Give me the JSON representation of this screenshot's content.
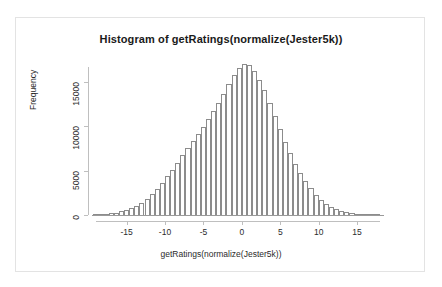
{
  "chart_data": {
    "type": "bar",
    "title": "Histogram of getRatings(normalize(Jester5k))",
    "xlabel": "getRatings(normalize(Jester5k))",
    "ylabel": "Frequency",
    "xlim": [
      -19.5,
      18.5
    ],
    "ylim": [
      0,
      17500
    ],
    "grid": false,
    "legend": null,
    "bin_width": 0.6667,
    "x_ticks": [
      -15,
      -10,
      -5,
      0,
      5,
      10,
      15
    ],
    "x_tick_labels": [
      "-15",
      "-10",
      "-5",
      "0",
      "5",
      "10",
      "15"
    ],
    "y_ticks": [
      0,
      5000,
      10000,
      15000
    ],
    "y_tick_labels": [
      "0",
      "5000",
      "10000",
      "15000"
    ],
    "bin_centers": [
      -19.0,
      -18.33,
      -17.67,
      -17.0,
      -16.33,
      -15.67,
      -15.0,
      -14.33,
      -13.67,
      -13.0,
      -12.33,
      -11.67,
      -11.0,
      -10.33,
      -9.67,
      -9.0,
      -8.33,
      -7.67,
      -7.0,
      -6.33,
      -5.67,
      -5.0,
      -4.33,
      -3.67,
      -3.0,
      -2.33,
      -1.67,
      -1.0,
      -0.33,
      0.33,
      1.0,
      1.67,
      2.33,
      3.0,
      3.67,
      4.33,
      5.0,
      5.67,
      6.33,
      7.0,
      7.67,
      8.33,
      9.0,
      9.67,
      10.33,
      11.0,
      11.67,
      12.33,
      13.0,
      13.67,
      14.33,
      15.0,
      15.67,
      16.33,
      17.0,
      17.67
    ],
    "values": [
      60,
      90,
      130,
      190,
      280,
      400,
      560,
      780,
      1050,
      1400,
      1850,
      2350,
      2950,
      3600,
      4350,
      5100,
      5900,
      6750,
      7550,
      8350,
      9150,
      9950,
      10800,
      11700,
      12700,
      13700,
      14800,
      15800,
      16600,
      17000,
      16900,
      16300,
      15300,
      14100,
      12700,
      11200,
      9700,
      8300,
      7000,
      5800,
      4750,
      3800,
      3000,
      2300,
      1750,
      1300,
      950,
      680,
      470,
      330,
      230,
      160,
      110,
      75,
      50,
      30
    ]
  }
}
